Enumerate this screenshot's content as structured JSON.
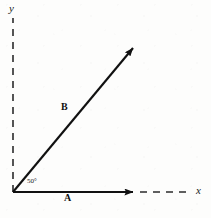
{
  "figure": {
    "background_color": "#fdfdfc",
    "ink_color": "#111111",
    "caption": "",
    "origin": {
      "x": 13,
      "y": 192
    }
  },
  "axes": {
    "y_axis": {
      "label": "y",
      "style": "dashed",
      "from": {
        "x": 13,
        "y": 192
      },
      "to": {
        "x": 13,
        "y": 18
      }
    },
    "x_axis": {
      "label": "x",
      "style": "dashed-extension",
      "solid_to": {
        "x": 136,
        "y": 192
      },
      "dashed_to": {
        "x": 191,
        "y": 192
      }
    }
  },
  "vectors": [
    {
      "name": "A",
      "label": "A",
      "style": "solid-arrow",
      "from": {
        "x": 13,
        "y": 192
      },
      "to": {
        "x": 136,
        "y": 192
      },
      "direction_deg": 0
    },
    {
      "name": "B",
      "label": "B",
      "style": "solid-arrow",
      "from": {
        "x": 13,
        "y": 192
      },
      "to": {
        "x": 136,
        "y": 45
      },
      "direction_deg": 50
    }
  ],
  "angle": {
    "value": "50",
    "unit": "°",
    "text": "50°",
    "between": [
      "A",
      "B"
    ],
    "vertex": {
      "x": 13,
      "y": 192
    }
  }
}
